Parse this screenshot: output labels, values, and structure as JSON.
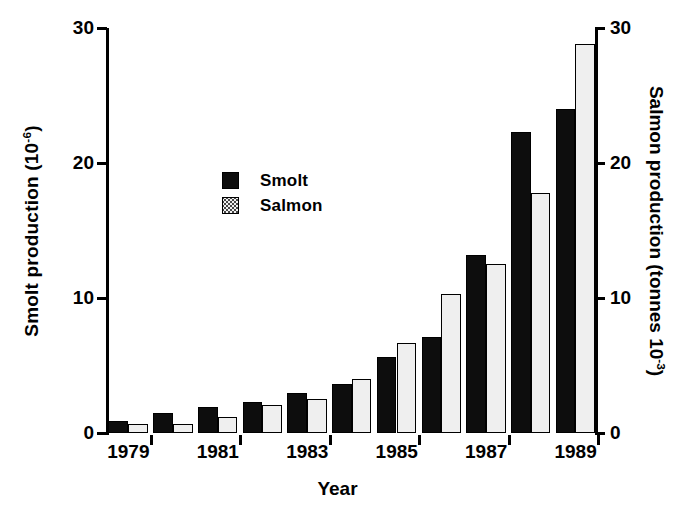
{
  "chart_data": {
    "type": "bar",
    "title": "",
    "xlabel": "Year",
    "ylabel_left": "Smolt production (10-6)",
    "ylabel_right": "Salmon production (tonnes 10-3)",
    "categories": [
      "1979",
      "1980",
      "1981",
      "1982",
      "1983",
      "1984",
      "1985",
      "1986",
      "1987",
      "1988",
      "1989"
    ],
    "series": [
      {
        "name": "Smolt",
        "values": [
          0.9,
          1.5,
          1.9,
          2.3,
          3.0,
          3.6,
          5.6,
          7.1,
          13.2,
          22.3,
          24.0
        ]
      },
      {
        "name": "Salmon",
        "values": [
          0.7,
          0.7,
          1.2,
          2.1,
          2.5,
          4.0,
          6.7,
          10.3,
          12.5,
          17.8,
          28.8
        ]
      }
    ],
    "ylim_left": [
      0,
      30
    ],
    "ylim_right": [
      0,
      30
    ],
    "yticks_left": [
      "0",
      "10",
      "20",
      "30"
    ],
    "ytick_values_left": [
      0,
      10,
      20,
      30
    ],
    "yticks_right": [
      "0",
      "10",
      "20",
      "30"
    ],
    "ytick_values_right": [
      0,
      10,
      20,
      30
    ],
    "xtick_labels": [
      "1979",
      "1981",
      "1983",
      "1985",
      "1987",
      "1989"
    ],
    "grid": false,
    "legend_position": "upper-left-inside"
  },
  "axes": {
    "left_title_main": "Smolt production (10",
    "left_title_sup": "-6",
    "left_title_close": ")",
    "right_title_main": "Salmon production (tonnes 10",
    "right_title_sup": "-3",
    "right_title_close": ")",
    "x_title": "Year"
  },
  "legend": {
    "items": [
      {
        "label": "Smolt",
        "swatch": "black-square-icon"
      },
      {
        "label": "Salmon",
        "swatch": "stippled-square-icon"
      }
    ]
  },
  "colors": {
    "smolt": "#0d0d0d",
    "salmon_fill": "#efefef",
    "salmon_dots": "#4a4a4a",
    "axis": "#000000",
    "background": "#ffffff"
  }
}
